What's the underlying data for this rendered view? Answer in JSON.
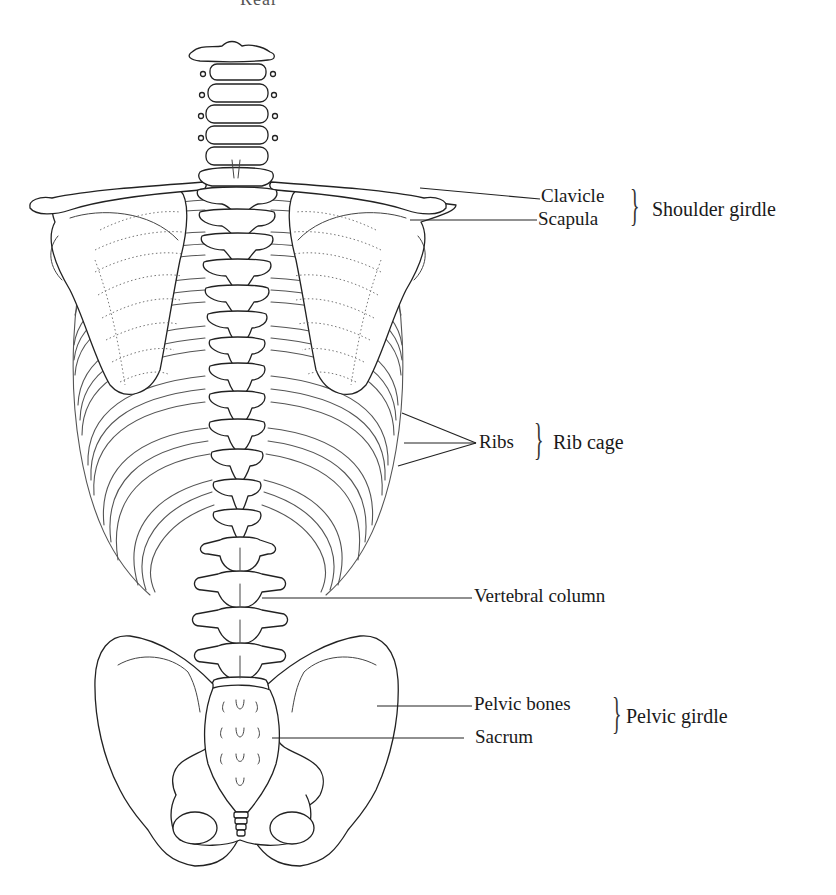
{
  "figure": {
    "title_fragment": "Rear",
    "view": "posterior view of the human trunk skeleton"
  },
  "labels": {
    "clavicle": "Clavicle",
    "scapula": "Scapula",
    "ribs": "Ribs",
    "vertebral_column": "Vertebral column",
    "pelvic_bones": "Pelvic bones",
    "sacrum": "Sacrum"
  },
  "groups": {
    "shoulder_girdle": "Shoulder girdle",
    "rib_cage": "Rib cage",
    "pelvic_girdle": "Pelvic girdle"
  },
  "brace_glyph": "}",
  "colors": {
    "line": "#222222",
    "text": "#1a1a1a",
    "background": "#ffffff"
  }
}
